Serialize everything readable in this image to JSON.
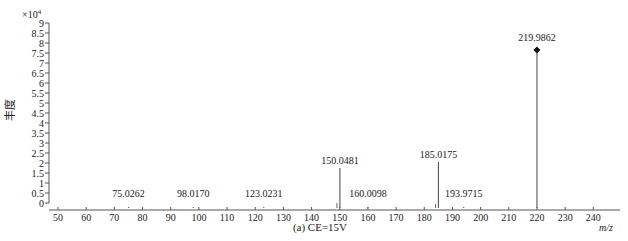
{
  "chart_data": {
    "type": "bar",
    "subtype": "mass-spectrum-stick",
    "title": "(a) CE=15V",
    "xlabel": "m/z",
    "ylabel": "丰度",
    "y_multiplier_label": "×10",
    "y_multiplier_exp": "4",
    "xlim": [
      45,
      250
    ],
    "ylim": [
      0,
      9
    ],
    "x_ticks": [
      50,
      60,
      70,
      80,
      90,
      100,
      110,
      120,
      130,
      140,
      150,
      160,
      170,
      180,
      190,
      200,
      210,
      220,
      230,
      240
    ],
    "y_ticks": [
      0,
      0.5,
      1,
      1.5,
      2,
      2.5,
      3,
      3.5,
      4,
      4.5,
      5,
      5.5,
      6,
      6.5,
      7,
      7.5,
      8,
      8.5,
      9
    ],
    "y_tick_labels": [
      "0",
      "0.5",
      "1",
      "1.5",
      "2",
      "2.5",
      "3",
      "3.5",
      "4",
      "4.5",
      "5",
      "5.5",
      "6",
      "6.5",
      "7",
      "7.5",
      "8",
      "8.5",
      "9"
    ],
    "grid": false,
    "legend": null,
    "peaks": [
      {
        "mz": 75.0262,
        "label": "75.0262",
        "intensity": 0.05,
        "label_y": 0.55
      },
      {
        "mz": 98.017,
        "label": "98.0170",
        "intensity": 0.05,
        "label_y": 0.55
      },
      {
        "mz": 123.0231,
        "label": "123.0231",
        "intensity": 0.05,
        "label_y": 0.55
      },
      {
        "mz": 150.0481,
        "label": "150.0481",
        "intensity": 2.0,
        "label_y": 2.2
      },
      {
        "mz": 160.0098,
        "label": "160.0098",
        "intensity": 0.05,
        "label_y": 0.55
      },
      {
        "mz": 185.0175,
        "label": "185.0175",
        "intensity": 2.3,
        "label_y": 2.5
      },
      {
        "mz": 193.9715,
        "label": "193.9715",
        "intensity": 0.05,
        "label_y": 0.55
      },
      {
        "mz": 219.9862,
        "label": "219.9862",
        "intensity": 7.9,
        "label_y": 8.35,
        "marker": "diamond"
      }
    ],
    "minor_peaks": [
      {
        "mz": 149.0,
        "intensity": 0.25
      },
      {
        "mz": 184.0,
        "intensity": 0.2
      }
    ]
  }
}
